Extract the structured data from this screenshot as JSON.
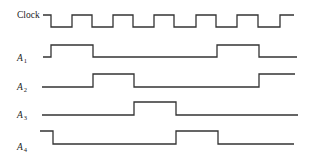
{
  "diagram": {
    "type": "timing-diagram",
    "stroke_color": "#333333",
    "signals": [
      {
        "id": "clock",
        "label": "Clock",
        "subscript": "",
        "label_x": 17,
        "label_y": 18,
        "high_y": 15,
        "low_y": 27,
        "start_x": 43,
        "end_x": 294,
        "initial": "high",
        "transitions_x": [
          51,
          72,
          92,
          113,
          133,
          154,
          174,
          196,
          216,
          237,
          258,
          280
        ]
      },
      {
        "id": "a1",
        "label": "A",
        "subscript": "1",
        "label_x": 17,
        "label_y": 61,
        "high_y": 45,
        "low_y": 57,
        "start_x": 43,
        "end_x": 297,
        "initial": "low",
        "transitions_x": [
          51,
          93,
          217,
          259
        ]
      },
      {
        "id": "a2",
        "label": "A",
        "subscript": "2",
        "label_x": 17,
        "label_y": 90,
        "high_y": 74,
        "low_y": 87,
        "start_x": 42,
        "end_x": 295,
        "initial": "low",
        "transitions_x": [
          93,
          134,
          259
        ]
      },
      {
        "id": "a3",
        "label": "A",
        "subscript": "3",
        "label_x": 17,
        "label_y": 118,
        "high_y": 102,
        "low_y": 115,
        "start_x": 42,
        "end_x": 298,
        "initial": "low",
        "transitions_x": [
          134,
          176
        ]
      },
      {
        "id": "a4",
        "label": "A",
        "subscript": "4",
        "label_x": 17,
        "label_y": 150,
        "high_y": 131,
        "low_y": 144,
        "start_x": 40,
        "end_x": 294,
        "initial": "high",
        "transitions_x": [
          53,
          176,
          218
        ]
      }
    ]
  }
}
